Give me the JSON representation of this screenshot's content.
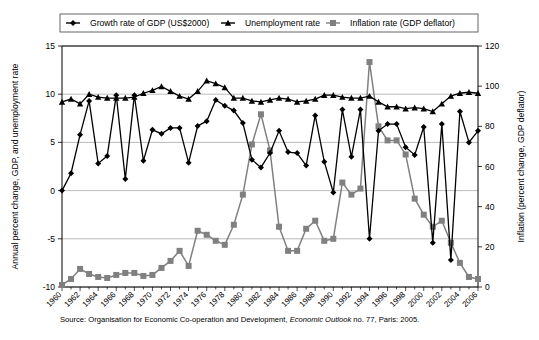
{
  "legend": {
    "items": [
      {
        "label": "Growth rate of GDP (US$2000)",
        "color": "#000000",
        "marker": "diamond"
      },
      {
        "label": "Unemployment rate",
        "color": "#000000",
        "marker": "triangle"
      },
      {
        "label": "Inflation rate (GDP deflator)",
        "color": "#808080",
        "marker": "square"
      }
    ]
  },
  "axes": {
    "left_title": "Annual percent change, GDP, and unemployment rate",
    "right_title": "Inflation (percent change, GDP deflator)",
    "left_ticks": [
      "15",
      "10",
      "5",
      "0",
      "-5",
      "-10"
    ],
    "right_ticks": [
      "120",
      "100",
      "80",
      "60",
      "40",
      "20",
      "0"
    ]
  },
  "source": {
    "prefix": "Source: Organisation for Economic Co-operation and Development, ",
    "italic": "Economic Outlook",
    "suffix": " no. 77, Paris: 2005."
  },
  "chart_data": {
    "type": "line",
    "title": "",
    "xlabel": "",
    "ylabel": "Annual percent change, GDP, and unemployment rate",
    "y2label": "Inflation (percent change, GDP deflator)",
    "ylim": [
      -10,
      15
    ],
    "y2lim": [
      0,
      120
    ],
    "xlim": [
      1960,
      2006
    ],
    "grid": true,
    "legend_position": "top",
    "x": [
      1960,
      1961,
      1962,
      1963,
      1964,
      1965,
      1966,
      1967,
      1968,
      1969,
      1970,
      1971,
      1972,
      1973,
      1974,
      1975,
      1976,
      1977,
      1978,
      1979,
      1980,
      1981,
      1982,
      1983,
      1984,
      1985,
      1986,
      1987,
      1988,
      1989,
      1990,
      1991,
      1992,
      1993,
      1994,
      1995,
      1996,
      1997,
      1998,
      1999,
      2000,
      2001,
      2002,
      2003,
      2004,
      2005,
      2006
    ],
    "xtick_labels": [
      "1960",
      "1962",
      "1964",
      "1966",
      "1968",
      "1970",
      "1972",
      "1974",
      "1976",
      "1978",
      "1980",
      "1982",
      "1984",
      "1986",
      "1988",
      "1990",
      "1992",
      "1994",
      "1996",
      "1998",
      "2000",
      "2002",
      "2004",
      "2006"
    ],
    "series": [
      {
        "name": "Growth rate of GDP (US$2000)",
        "axis": "left",
        "color": "#000000",
        "marker": "diamond",
        "values": [
          0.0,
          1.8,
          5.8,
          9.3,
          2.8,
          3.6,
          9.9,
          1.2,
          9.9,
          3.1,
          6.3,
          5.9,
          6.5,
          6.5,
          2.9,
          6.7,
          7.2,
          9.4,
          8.8,
          8.3,
          7.0,
          3.2,
          2.4,
          3.9,
          6.2,
          4.0,
          3.9,
          2.6,
          7.8,
          3.0,
          -0.2,
          8.4,
          3.5,
          8.4,
          -5.0,
          6.2,
          6.9,
          6.9,
          4.5,
          3.7,
          6.6,
          -5.4,
          6.9,
          -7.2,
          8.2,
          5.0,
          6.2
        ]
      },
      {
        "name": "Unemployment rate",
        "axis": "left",
        "color": "#000000",
        "marker": "triangle",
        "values": [
          9.2,
          9.5,
          9.0,
          10.0,
          9.7,
          9.6,
          9.6,
          9.6,
          9.7,
          10.1,
          10.4,
          10.8,
          10.3,
          9.8,
          9.5,
          10.3,
          11.4,
          11.1,
          10.7,
          9.6,
          9.6,
          9.3,
          9.2,
          9.4,
          9.6,
          9.5,
          9.2,
          9.3,
          9.5,
          9.9,
          9.9,
          9.7,
          9.6,
          9.6,
          9.8,
          9.2,
          8.7,
          8.7,
          8.5,
          8.6,
          8.5,
          8.2,
          9.0,
          9.8,
          10.1,
          10.2,
          10.1
        ]
      },
      {
        "name": "Inflation rate (GDP deflator)",
        "axis": "right",
        "color": "#808080",
        "marker": "square",
        "values": [
          1.0,
          4.0,
          9.0,
          6.5,
          5.0,
          4.5,
          6.0,
          7.0,
          7.0,
          5.5,
          6.0,
          9.5,
          13.0,
          18.0,
          10.5,
          28.0,
          26.0,
          23.0,
          21.0,
          31.0,
          46.0,
          71.0,
          86.0,
          68.0,
          30.0,
          18.0,
          18.0,
          29.0,
          33.0,
          23.0,
          24.0,
          52.0,
          46.0,
          49.0,
          112.0,
          80.0,
          73.0,
          73.0,
          66.0,
          44.0,
          36.0,
          30.0,
          33.0,
          22.0,
          12.0,
          5.0,
          4.0
        ]
      }
    ]
  }
}
